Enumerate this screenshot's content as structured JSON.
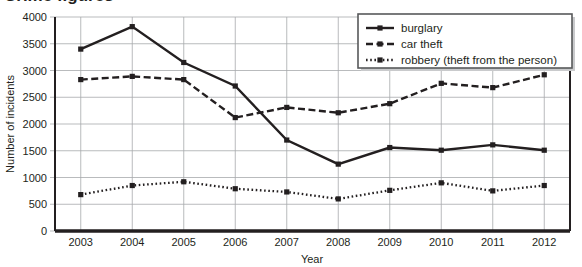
{
  "title": {
    "text": "Crime figures",
    "visible_note": "cut off at top edge"
  },
  "chart_data": {
    "type": "line",
    "title": "Crime figures",
    "xlabel": "Year",
    "ylabel": "Number of incidents",
    "categories": [
      "2003",
      "2004",
      "2005",
      "2006",
      "2007",
      "2008",
      "2009",
      "2010",
      "2011",
      "2012"
    ],
    "ylim": [
      0,
      4000
    ],
    "ytick_labels": [
      "0",
      "500",
      "1000",
      "1500",
      "2000",
      "2500",
      "3000",
      "3500",
      "4000"
    ],
    "ytick_values": [
      0,
      500,
      1000,
      1500,
      2000,
      2500,
      3000,
      3500,
      4000
    ],
    "grid": true,
    "legend_position": "top-right",
    "series": [
      {
        "name": "burglary",
        "style": "solid",
        "values": [
          3400,
          3820,
          3150,
          2710,
          1700,
          1250,
          1560,
          1510,
          1610,
          1510
        ]
      },
      {
        "name": "car theft",
        "style": "dashed",
        "values": [
          2830,
          2890,
          2830,
          2120,
          2310,
          2210,
          2380,
          2760,
          2680,
          2920
        ]
      },
      {
        "name": "robbery (theft from the person)",
        "style": "dotted",
        "values": [
          680,
          850,
          920,
          790,
          730,
          600,
          760,
          900,
          750,
          850
        ]
      }
    ]
  },
  "legend": {
    "items": [
      {
        "label": "burglary",
        "style": "solid"
      },
      {
        "label": "car theft",
        "style": "dashed"
      },
      {
        "label": "robbery (theft from the person)",
        "style": "dotted"
      }
    ]
  },
  "colors": {
    "ink": "#231f20",
    "grid": "#a7a9ac",
    "background": "#ffffff",
    "legend_border": "#58595b"
  }
}
